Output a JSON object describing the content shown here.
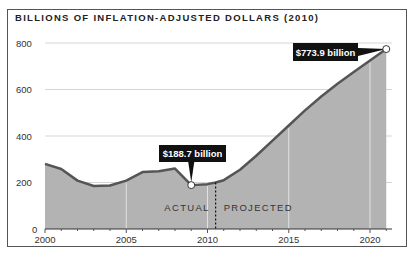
{
  "chart_data": {
    "type": "area",
    "title": "BILLIONS OF INFLATION-ADJUSTED DOLLARS (2010)",
    "xlabel": "",
    "ylabel": "",
    "xlim": [
      2000,
      2021
    ],
    "ylim": [
      0,
      800
    ],
    "x_ticks": [
      2000,
      2005,
      2010,
      2015,
      2020
    ],
    "y_ticks": [
      0,
      200,
      400,
      600,
      800
    ],
    "grid": true,
    "x": [
      2000,
      2001,
      2002,
      2003,
      2004,
      2005,
      2006,
      2007,
      2008,
      2009,
      2010,
      2010.5,
      2011,
      2012,
      2013,
      2014,
      2015,
      2016,
      2017,
      2018,
      2019,
      2020,
      2021
    ],
    "values": [
      280,
      258,
      208,
      185,
      187,
      208,
      245,
      248,
      260,
      188.7,
      193,
      200,
      210,
      255,
      315,
      380,
      445,
      510,
      570,
      625,
      675,
      725,
      773.9
    ],
    "zones": {
      "actual_label": "ACTUAL",
      "projected_label": "PROJECTED",
      "split_year": 2010.5
    },
    "annotations": [
      {
        "year": 2009,
        "value": 188.7,
        "label": "$188.7 billion"
      },
      {
        "year": 2021,
        "value": 773.9,
        "label": "$773.9 billion"
      }
    ],
    "colors": {
      "fill": "#b3b3b3",
      "line": "#555555",
      "grid": "#d5d5d5",
      "callout_bg": "#111111"
    }
  }
}
